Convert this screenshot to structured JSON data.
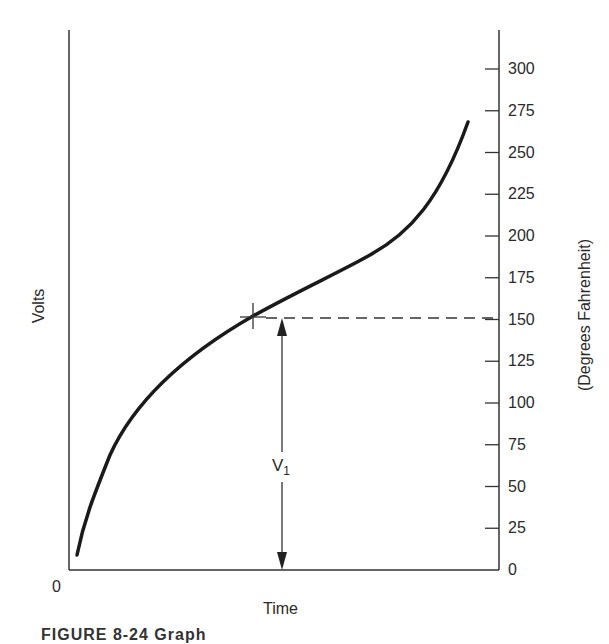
{
  "chart_data": {
    "type": "line",
    "title": "",
    "xlabel": "Time",
    "ylabel_left": "Volts",
    "ylabel_right": "(Degrees Fahrenheit)",
    "origin_label": "0",
    "right_axis": {
      "ticks": [
        0,
        25,
        50,
        75,
        100,
        125,
        150,
        175,
        200,
        225,
        250,
        275,
        300
      ],
      "tick_labels": [
        "0",
        "25",
        "50",
        "75",
        "100",
        "125",
        "150",
        "175",
        "200",
        "225",
        "250",
        "275",
        "300"
      ],
      "range": [
        0,
        300
      ]
    },
    "grid": false,
    "series": [
      {
        "name": "Temperature vs Time",
        "x_fraction": [
          0.02,
          0.06,
          0.12,
          0.19,
          0.31,
          0.42,
          0.61,
          0.73,
          0.82,
          0.93
        ],
        "y": [
          10,
          42,
          84,
          108,
          132,
          152,
          182,
          200,
          223,
          268
        ]
      }
    ],
    "annotations": [
      {
        "type": "marker",
        "shape": "crosshair",
        "y": 150,
        "x_fraction": 0.42
      },
      {
        "type": "dashed-line",
        "y": 150,
        "to": "right-axis"
      },
      {
        "type": "double-arrow",
        "label": "V",
        "subscript": "1",
        "from_y": 0,
        "to_y": 150
      }
    ]
  },
  "labels": {
    "volts": "Volts",
    "time": "Time",
    "origin": "0",
    "right_axis_title": "(Degrees Fahrenheit)",
    "v_label": "V",
    "v_sub": "1",
    "caption": "FIGURE 8-24   Graph"
  }
}
